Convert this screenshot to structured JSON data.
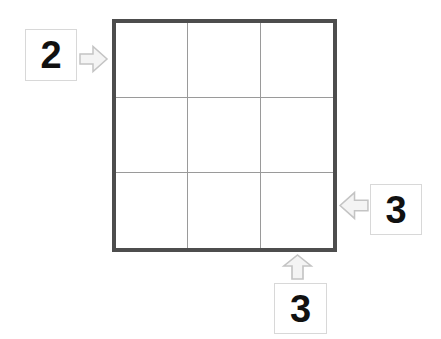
{
  "puzzle": {
    "type": "skyscrapers-grid",
    "grid": {
      "rows": 3,
      "columns": 3,
      "cells": [
        [
          "",
          "",
          ""
        ],
        [
          "",
          "",
          ""
        ],
        [
          "",
          "",
          ""
        ]
      ],
      "border_color": "#4d4d4d",
      "inner_line_color": "#9a9a9a",
      "background_color": "#ffffff"
    },
    "clues": [
      {
        "id": "left",
        "value": "2",
        "arrow_icon": "arrow-right-icon",
        "arrow_direction": "right",
        "target_row": 1,
        "position": "outside-left-row-1"
      },
      {
        "id": "right",
        "value": "3",
        "arrow_icon": "arrow-left-icon",
        "arrow_direction": "left",
        "target_row": 3,
        "position": "outside-right-row-3"
      },
      {
        "id": "bottom",
        "value": "3",
        "arrow_icon": "arrow-up-icon",
        "arrow_direction": "up",
        "target_column": 3,
        "position": "outside-bottom-column-3"
      }
    ],
    "colors": {
      "clue_text": "#111111",
      "clue_box_border": "#d8d8d8",
      "arrow_fill": "#f4f4f4",
      "arrow_stroke": "#c4c4c4",
      "page_background": "#ffffff"
    }
  }
}
